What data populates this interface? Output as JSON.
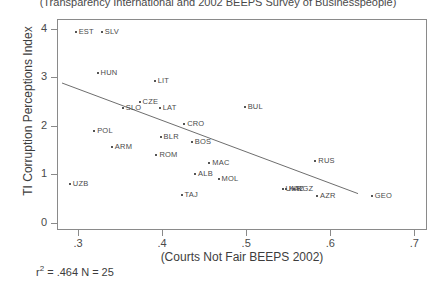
{
  "chart_data": {
    "type": "scatter",
    "title": "(Transparency International and 2002 BEEPS Survey of Businesspeople)",
    "xlabel": "(Courts Not Fair BEEPS 2002)",
    "ylabel": "TI Corruption Perceptions Index",
    "xlim": [
      0.275,
      0.715
    ],
    "ylim": [
      -0.15,
      4.2
    ],
    "xticks": [
      ".3",
      ".4",
      ".5",
      ".6",
      ".7"
    ],
    "xtick_values": [
      0.3,
      0.4,
      0.5,
      0.6,
      0.7
    ],
    "yticks": [
      "0",
      "1",
      "2",
      "3",
      "4"
    ],
    "ytick_values": [
      0,
      1,
      2,
      3,
      4
    ],
    "grid": false,
    "legend": null,
    "annotation": "r² = .464 N = 25",
    "r_squared": 0.464,
    "n": 25,
    "fit_line": {
      "x0": 0.281,
      "y0": 2.88,
      "x1": 0.633,
      "y1": 0.6
    },
    "points": [
      {
        "label": "EST",
        "x": 0.296,
        "y": 3.95
      },
      {
        "label": "SLV",
        "x": 0.327,
        "y": 3.95
      },
      {
        "label": "HUN",
        "x": 0.322,
        "y": 3.1
      },
      {
        "label": "LIT",
        "x": 0.39,
        "y": 2.95
      },
      {
        "label": "CZE",
        "x": 0.372,
        "y": 2.5
      },
      {
        "label": "SLO",
        "x": 0.352,
        "y": 2.38
      },
      {
        "label": "LAT",
        "x": 0.396,
        "y": 2.38
      },
      {
        "label": "BUL",
        "x": 0.497,
        "y": 2.4
      },
      {
        "label": "CRO",
        "x": 0.425,
        "y": 2.05
      },
      {
        "label": "POL",
        "x": 0.318,
        "y": 1.92
      },
      {
        "label": "BLR",
        "x": 0.397,
        "y": 1.78
      },
      {
        "label": "BOS",
        "x": 0.434,
        "y": 1.68
      },
      {
        "label": "ARM",
        "x": 0.339,
        "y": 1.58
      },
      {
        "label": "ROM",
        "x": 0.392,
        "y": 1.42
      },
      {
        "label": "MAC",
        "x": 0.455,
        "y": 1.25
      },
      {
        "label": "RUS",
        "x": 0.581,
        "y": 1.3
      },
      {
        "label": "ALB",
        "x": 0.438,
        "y": 1.02
      },
      {
        "label": "MOL",
        "x": 0.466,
        "y": 0.92
      },
      {
        "label": "UZB",
        "x": 0.289,
        "y": 0.82
      },
      {
        "label": "UKR",
        "x": 0.542,
        "y": 0.72
      },
      {
        "label": "KAZ",
        "x": 0.546,
        "y": 0.72
      },
      {
        "label": "KGZ",
        "x": 0.556,
        "y": 0.72
      },
      {
        "label": "TAJ",
        "x": 0.422,
        "y": 0.6
      },
      {
        "label": "AZR",
        "x": 0.583,
        "y": 0.58
      },
      {
        "label": "GEO",
        "x": 0.648,
        "y": 0.58
      }
    ]
  }
}
